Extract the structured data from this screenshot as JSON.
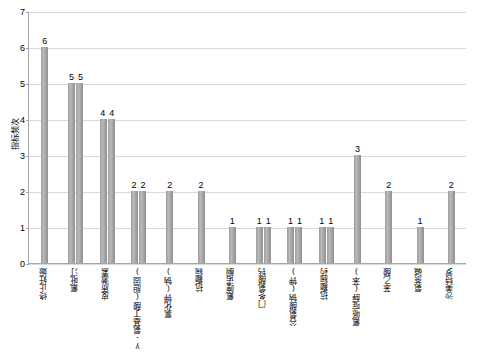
{
  "chart_data": {
    "type": "bar",
    "title": "",
    "xlabel": "",
    "ylabel": "指标频次",
    "ylim": [
      0,
      7
    ],
    "yticks": [
      "0",
      "1",
      "2",
      "3",
      "4",
      "5",
      "6",
      "7"
    ],
    "grid": true,
    "legend": false,
    "categories": [
      "终止妊娠",
      "氟吡汀",
      "皮质激素",
      "γ-氨基丁酸(胆固)",
      "氯化钾(钠)",
      "抗癫痫",
      "氟喹诺酮",
      "门冬氨酸钙",
      "谷氨酸钠(钾)",
      "抗癫痫药",
      "氟哌啶醇(苯)",
      "苯乙酸",
      "氨茶碱",
      "沙美特罗"
    ],
    "groups": [
      {
        "label": "终止妊娠",
        "values": [
          6
        ]
      },
      {
        "label": "氟吡汀",
        "values": [
          5,
          5
        ]
      },
      {
        "label": "皮质激素",
        "values": [
          4,
          4
        ]
      },
      {
        "label": "γ-氨基丁酸(胆固)",
        "values": [
          2,
          2
        ]
      },
      {
        "label": "氯化钾(钠)",
        "values": [
          2
        ]
      },
      {
        "label": "抗癫痫",
        "values": [
          2
        ]
      },
      {
        "label": "氟喹诺酮",
        "values": [
          1
        ]
      },
      {
        "label": "门冬氨酸钙",
        "values": [
          1,
          1
        ]
      },
      {
        "label": "谷氨酸钠(钾)",
        "values": [
          1,
          1
        ]
      },
      {
        "label": "抗癫痫药",
        "values": [
          1,
          1
        ]
      },
      {
        "label": "氟哌啶醇(苯)",
        "values": [
          3
        ]
      },
      {
        "label": "苯乙酸",
        "values": [
          2
        ]
      },
      {
        "label": "氨茶碱",
        "values": [
          1
        ]
      },
      {
        "label": "沙美特罗",
        "values": [
          2
        ]
      }
    ],
    "bar_color": "#a0a0a0"
  }
}
